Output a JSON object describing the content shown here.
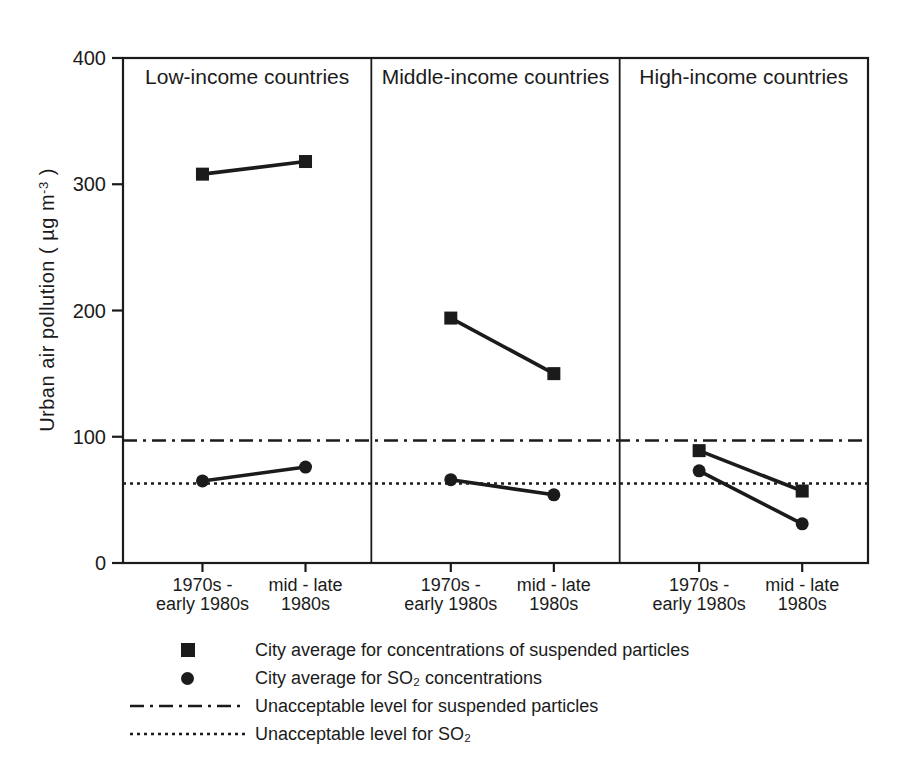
{
  "colors": {
    "ink": "#1b1b1b",
    "background": "#ffffff"
  },
  "chart_data": {
    "type": "line",
    "title": "",
    "ylabel": "Urban air pollution ( µg m⁻³ )",
    "ylabel_parts": {
      "pre": "Urban air pollution ( µg m",
      "sup": "-3",
      "post": " )"
    },
    "ylim": [
      0,
      400
    ],
    "yticks": [
      0,
      100,
      200,
      300,
      400
    ],
    "x_tick_labels": [
      [
        "1970s -",
        "early 1980s"
      ],
      [
        "mid - late",
        "1980s"
      ]
    ],
    "panels": [
      {
        "title": "Low-income countries",
        "series": [
          {
            "name": "suspended_particles",
            "marker": "square",
            "values": [
              308,
              318
            ]
          },
          {
            "name": "so2",
            "marker": "circle",
            "values": [
              65,
              76
            ]
          }
        ]
      },
      {
        "title": "Middle-income countries",
        "series": [
          {
            "name": "suspended_particles",
            "marker": "square",
            "values": [
              194,
              150
            ]
          },
          {
            "name": "so2",
            "marker": "circle",
            "values": [
              66,
              54
            ]
          }
        ]
      },
      {
        "title": "High-income countries",
        "series": [
          {
            "name": "suspended_particles",
            "marker": "square",
            "values": [
              89,
              57
            ]
          },
          {
            "name": "so2",
            "marker": "circle",
            "values": [
              73,
              31
            ]
          }
        ]
      }
    ],
    "reference_lines": [
      {
        "name": "suspended-particles",
        "value": 97,
        "style": "dash-dot"
      },
      {
        "name": "so2",
        "value": 63,
        "style": "dotted"
      }
    ],
    "legend": [
      {
        "marker": "square",
        "label": "City average for concentrations of suspended particles"
      },
      {
        "marker": "circle",
        "label": "City average for SO₂ concentrations"
      },
      {
        "marker": "dash-dot-line",
        "label": "Unacceptable level for suspended particles"
      },
      {
        "marker": "dotted-line",
        "label": "Unacceptable level for SO₂"
      }
    ]
  }
}
